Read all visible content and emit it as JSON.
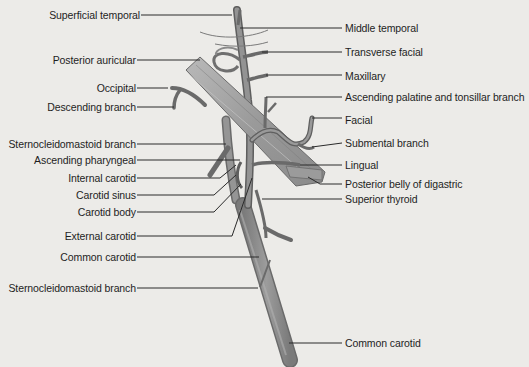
{
  "figure": {
    "type": "anatomical diagram",
    "colors": {
      "background": "#ecebe8",
      "artery_fill": "#8f8f8f",
      "artery_edge": "#5e5e5e",
      "muscle_fill": "#a8a8a8",
      "leader_line": "#2a2a2a",
      "text": "#1e1e1e"
    }
  },
  "labels_left": [
    {
      "text": "Superficial temporal",
      "x": 140,
      "y": 15
    },
    {
      "text": "Posterior auricular",
      "x": 136,
      "y": 60
    },
    {
      "text": "Occipital",
      "x": 136,
      "y": 88
    },
    {
      "text": "Descending branch",
      "x": 136,
      "y": 107
    },
    {
      "text": "Sternocleidomastoid branch",
      "x": 136,
      "y": 144
    },
    {
      "text": "Ascending pharyngeal",
      "x": 136,
      "y": 160
    },
    {
      "text": "Internal carotid",
      "x": 136,
      "y": 178
    },
    {
      "text": "Carotid sinus",
      "x": 136,
      "y": 195
    },
    {
      "text": "Carotid body",
      "x": 136,
      "y": 212
    },
    {
      "text": "External carotid",
      "x": 136,
      "y": 236
    },
    {
      "text": "Common carotid",
      "x": 136,
      "y": 257
    },
    {
      "text": "Sternocleidomastoid branch",
      "x": 136,
      "y": 288
    }
  ],
  "labels_right": [
    {
      "text": "Middle temporal",
      "x": 345,
      "y": 28
    },
    {
      "text": "Transverse facial",
      "x": 345,
      "y": 52
    },
    {
      "text": "Maxillary",
      "x": 345,
      "y": 76
    },
    {
      "text": "Ascending palatine and tonsillar branch",
      "x": 345,
      "y": 97
    },
    {
      "text": "Facial",
      "x": 345,
      "y": 120
    },
    {
      "text": "Submental branch",
      "x": 345,
      "y": 143
    },
    {
      "text": "Lingual",
      "x": 345,
      "y": 165
    },
    {
      "text": "Posterior belly of digastric",
      "x": 345,
      "y": 184
    },
    {
      "text": "Superior thyroid",
      "x": 345,
      "y": 199
    },
    {
      "text": "Common carotid",
      "x": 345,
      "y": 343
    }
  ]
}
